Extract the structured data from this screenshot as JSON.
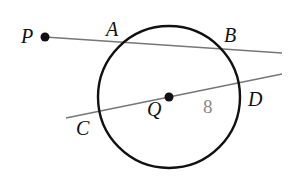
{
  "diagram": {
    "type": "geometry",
    "colors": {
      "circle": "#111111",
      "lines": "#777777",
      "points": "#111111",
      "labels": "#111111",
      "measure": "#888888"
    },
    "circle": {
      "center": "Q",
      "cx": 169,
      "cy": 97,
      "r": 71
    },
    "points": {
      "P": {
        "label": "P",
        "x": 45,
        "y": 37,
        "dot": true
      },
      "A": {
        "label": "A",
        "on": "circle"
      },
      "B": {
        "label": "B",
        "on": "circle"
      },
      "Q": {
        "label": "Q",
        "x": 169,
        "y": 97,
        "dot": true
      },
      "C": {
        "label": "C",
        "on": "circle"
      },
      "D": {
        "label": "D",
        "on": "circle"
      }
    },
    "segments": [
      {
        "name": "secant-PB",
        "from": [
          45,
          37
        ],
        "to": [
          282,
          53
        ]
      },
      {
        "name": "line-CD",
        "from": [
          66,
          118
        ],
        "to": [
          282,
          74
        ]
      }
    ],
    "measure": {
      "label": "8",
      "segment": "QD"
    }
  }
}
